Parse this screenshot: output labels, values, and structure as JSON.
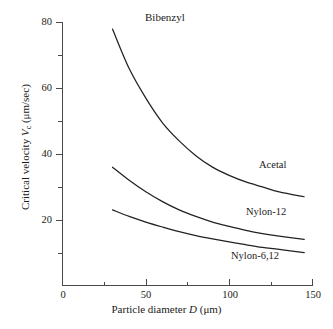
{
  "chart_data": {
    "type": "line",
    "title": "Bibenzyl",
    "xlabel": "Particle diameter D (μm)",
    "ylabel": "Critical velocity V_c (μm/sec)",
    "xlim": [
      0,
      150
    ],
    "ylim": [
      0,
      80
    ],
    "grid": false,
    "legend_position": "inline-curve-labels",
    "xticks": [
      0,
      50,
      100,
      150
    ],
    "xticklabels": [
      "0",
      "50",
      "100",
      "150"
    ],
    "xminorticks": [
      25,
      75,
      125
    ],
    "yticks": [
      20,
      40,
      60,
      80
    ],
    "yticklabels": [
      "20",
      "40",
      "60",
      "80"
    ],
    "yminorticks": [
      10,
      30,
      50,
      70
    ],
    "series": [
      {
        "name": "Acetal",
        "x": [
          30,
          40,
          50,
          60,
          70,
          80,
          90,
          100,
          110,
          120,
          130,
          145
        ],
        "values": [
          78.0,
          66.0,
          57.0,
          49.5,
          44.0,
          39.5,
          36.0,
          33.5,
          31.5,
          30.0,
          28.5,
          27.0
        ]
      },
      {
        "name": "Nylon-12",
        "x": [
          30,
          40,
          50,
          60,
          70,
          80,
          90,
          100,
          110,
          120,
          130,
          145
        ],
        "values": [
          36.0,
          32.0,
          28.5,
          25.5,
          23.0,
          21.0,
          19.3,
          18.0,
          16.8,
          15.8,
          15.0,
          14.0
        ]
      },
      {
        "name": "Nylon-6,12",
        "x": [
          30,
          40,
          50,
          60,
          70,
          80,
          90,
          100,
          110,
          120,
          130,
          145
        ],
        "values": [
          23.0,
          21.0,
          19.3,
          17.8,
          16.4,
          15.2,
          14.2,
          13.3,
          12.4,
          11.6,
          11.0,
          10.0
        ]
      }
    ]
  },
  "axes": {
    "x_title_prefix": "Particle diameter ",
    "x_title_var": "D",
    "x_title_unit": " (μm)",
    "y_title_prefix": "Critical velocity ",
    "y_title_var": "V",
    "y_title_sub": "c",
    "y_title_unit": " (μm/sec)"
  },
  "labels": {
    "acetal": "Acetal",
    "nylon12": "Nylon-12",
    "nylon612": "Nylon-6,12",
    "title": "Bibenzyl"
  },
  "ticks": {
    "x": [
      "0",
      "50",
      "100",
      "150"
    ],
    "y": [
      "80",
      "60",
      "40",
      "20"
    ]
  },
  "colors": {
    "curve": "#222222",
    "axis": "#4a4a4a",
    "background": "#ffffff",
    "text": "#1a1a1a"
  }
}
